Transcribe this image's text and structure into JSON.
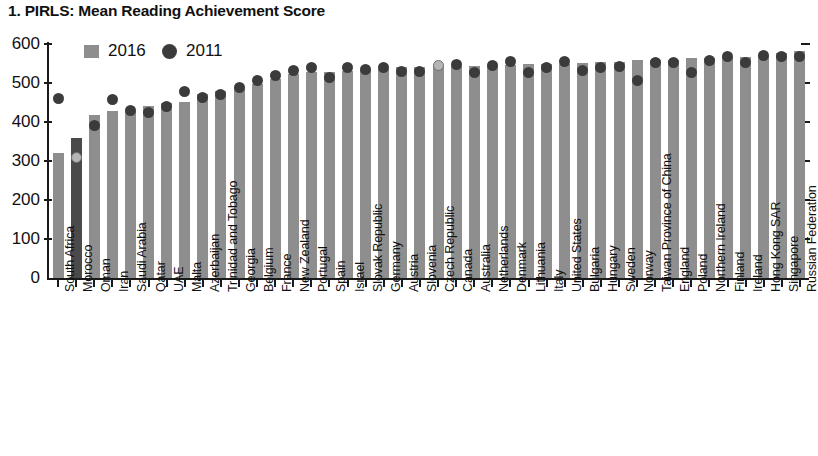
{
  "chart_data": {
    "type": "bar",
    "title": "1. PIRLS: Mean Reading Achievement Score",
    "xlabel": "",
    "ylabel": "",
    "ylim": [
      0,
      600
    ],
    "yticks": [
      0,
      100,
      200,
      300,
      400,
      500,
      600
    ],
    "grid": false,
    "legend_position": "top-left",
    "legend": [
      {
        "name": "2016",
        "marker": "square",
        "color": "#8e8e8e"
      },
      {
        "name": "2011",
        "marker": "circle",
        "color": "#3b3b3b"
      }
    ],
    "categories": [
      "South Africa",
      "Morocco",
      "Oman",
      "Iran",
      "Saudi Arabia",
      "Qatar",
      "UAE",
      "Malta",
      "Azerbaijan",
      "Trinidad and Tobago",
      "Georgia",
      "Belgium",
      "France",
      "New Zealand",
      "Portugal",
      "Spain",
      "Israel",
      "Slovak Republic",
      "Germany",
      "Austria",
      "Slovenia",
      "Czech Republic",
      "Canada",
      "Australia",
      "Netherlands",
      "Denmark",
      "Lithuania",
      "Italy",
      "United States",
      "Bulgaria",
      "Hungary",
      "Sweden",
      "Norway",
      "Taiwan Province of China",
      "England",
      "Poland",
      "Northern Ireland",
      "Finland",
      "Ireland",
      "Hong Kong SAR",
      "Singapore",
      "Russian Federation"
    ],
    "series": [
      {
        "name": "2016",
        "marker": "square",
        "values": [
          320,
          358,
          418,
          428,
          430,
          442,
          450,
          452,
          472,
          479,
          488,
          498,
          511,
          523,
          528,
          528,
          530,
          535,
          537,
          541,
          542,
          543,
          543,
          544,
          545,
          547,
          548,
          548,
          549,
          552,
          554,
          555,
          559,
          559,
          559,
          565,
          565,
          566,
          567,
          569,
          576,
          581
        ]
      },
      {
        "name": "2011",
        "marker": "circle",
        "values": [
          461,
          310,
          391,
          457,
          430,
          425,
          439,
          477,
          462,
          471,
          488,
          506,
          520,
          531,
          541,
          513,
          541,
          535,
          541,
          529,
          530,
          545,
          548,
          527,
          546,
          554,
          528,
          541,
          556,
          532,
          539,
          542,
          507,
          553,
          552,
          526,
          558,
          568,
          552,
          571,
          567,
          568
        ]
      }
    ]
  }
}
